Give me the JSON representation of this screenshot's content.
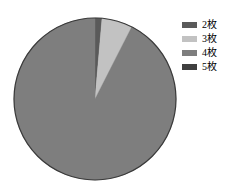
{
  "chart_data": {
    "type": "pie",
    "title": "",
    "subtitle": "",
    "xlabel": "",
    "ylabel": "",
    "grid": false,
    "legend_position": "right-top",
    "start_angle_deg": 0,
    "direction": "clockwise",
    "categories": [
      "2枚",
      "3枚",
      "4枚",
      "5枚"
    ],
    "values": [
      1.4,
      6.1,
      92.5,
      0
    ],
    "colors": [
      "#5a5a5a",
      "#c2c2c2",
      "#7e7e7e",
      "#3f3f3f"
    ],
    "slices": [
      {
        "label": "2枚",
        "value": 1.4,
        "color": "#5a5a5a",
        "start_deg": 0,
        "end_deg": 5
      },
      {
        "label": "3枚",
        "value": 6.1,
        "color": "#c2c2c2",
        "start_deg": 5,
        "end_deg": 27
      },
      {
        "label": "4枚",
        "value": 92.5,
        "color": "#7e7e7e",
        "start_deg": 27,
        "end_deg": 360
      },
      {
        "label": "5枚",
        "value": 0,
        "color": "#3f3f3f",
        "start_deg": 360,
        "end_deg": 360
      }
    ]
  },
  "pie": {
    "center_x": 95,
    "center_y": 99,
    "radius": 81,
    "outline_color": "#3a3a3a",
    "outline_width": 1.2
  },
  "legend": {
    "items": [
      {
        "label": "2枚",
        "color": "#5a5a5a"
      },
      {
        "label": "3枚",
        "color": "#c2c2c2"
      },
      {
        "label": "4枚",
        "color": "#7e7e7e"
      },
      {
        "label": "5枚",
        "color": "#3f3f3f"
      }
    ]
  },
  "background": "#ffffff"
}
